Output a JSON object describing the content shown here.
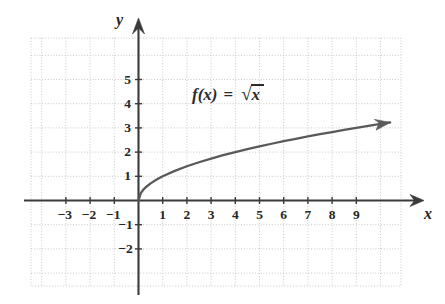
{
  "chart_data": {
    "type": "line",
    "title": "",
    "annotation": "f(x) = √x",
    "function": "sqrt(x)",
    "xlabel": "x",
    "ylabel": "y",
    "xlim": [
      -3.9,
      10.9
    ],
    "ylim": [
      -2.9,
      6.1
    ],
    "grid": true,
    "grid_step": 1,
    "legend": "none",
    "x_ticks": [
      -3,
      -2,
      -1,
      1,
      2,
      3,
      4,
      5,
      6,
      7,
      8,
      9
    ],
    "x_tick_labels": [
      "-3",
      "-2",
      "-1",
      "1",
      "2",
      "3",
      "4",
      "5",
      "6",
      "7",
      "8",
      "9"
    ],
    "y_ticks": [
      -2,
      -1,
      1,
      2,
      3,
      4,
      5
    ],
    "y_tick_labels": [
      "-2",
      "-1",
      "1",
      "2",
      "3",
      "4",
      "5"
    ],
    "x": [
      0,
      0.1,
      0.2,
      0.3,
      0.5,
      0.75,
      1,
      1.5,
      2,
      2.5,
      3,
      3.5,
      4,
      4.5,
      5,
      5.5,
      6,
      6.5,
      7,
      7.5,
      8,
      8.5,
      9,
      9.5,
      10,
      10.4
    ],
    "values": [
      0,
      0.316,
      0.447,
      0.548,
      0.707,
      0.866,
      1,
      1.225,
      1.414,
      1.581,
      1.732,
      1.871,
      2,
      2.121,
      2.236,
      2.345,
      2.449,
      2.55,
      2.646,
      2.739,
      2.828,
      2.915,
      3,
      3.082,
      3.162,
      3.225
    ],
    "curve_color": "#595959",
    "axis_color": "#3a3a3a",
    "grid_color": "#c8c8c8",
    "curve_has_arrow": true,
    "x_axis_has_arrow": true,
    "y_axis_has_arrow": true
  },
  "labels": {
    "x_axis_name": "x",
    "y_axis_name": "y",
    "formula_fx": "f(x)",
    "formula_eq": "=",
    "formula_var": "x"
  }
}
